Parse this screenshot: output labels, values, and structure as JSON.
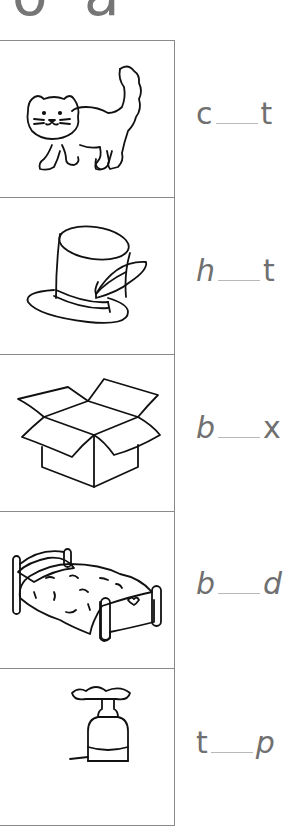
{
  "header": {
    "partial_letters": [
      "o",
      "a"
    ]
  },
  "rows": [
    {
      "picture": "cat",
      "first": "c",
      "last": "t",
      "answer_blank": "___"
    },
    {
      "picture": "top hat",
      "first": "h",
      "last": "t",
      "answer_blank": "___"
    },
    {
      "picture": "box",
      "first": "b",
      "last": "x",
      "answer_blank": "___"
    },
    {
      "picture": "bed",
      "first": "b",
      "last": "d",
      "answer_blank": "___"
    },
    {
      "picture": "tap",
      "first": "t",
      "last": "p",
      "answer_blank": "___"
    }
  ],
  "colors": {
    "text": "#707070",
    "border": "#8a8a8a",
    "blank_line": "#b8b8b8"
  }
}
